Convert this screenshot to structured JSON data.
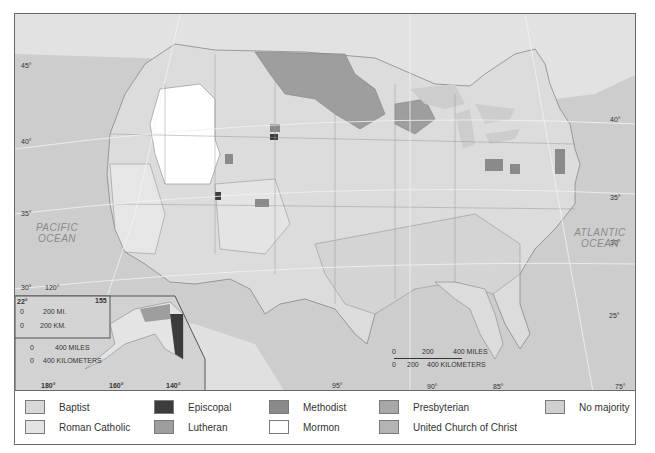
{
  "map": {
    "title": "Religious majority by county, United States",
    "oceans": [
      {
        "name": "PACIFIC",
        "line2": "OCEAN"
      },
      {
        "name": "ATLANTIC",
        "line2": "OCEAN"
      }
    ],
    "latitude_labels": [
      "45°",
      "40°",
      "35°",
      "30°",
      "25°"
    ],
    "longitude_labels": [
      "120°",
      "95°",
      "90°",
      "85°",
      "75°"
    ],
    "latitude_labels_east": [
      "40°",
      "35°",
      "30°",
      "25°"
    ],
    "scale_bar": {
      "miles_labels": [
        "0",
        "200",
        "400 MILES"
      ],
      "km_labels": [
        "0",
        "200",
        "400 KILOMETERS"
      ]
    },
    "alaska_inset": {
      "longitude_labels": [
        "180°",
        "160°",
        "140°"
      ],
      "scale_miles": [
        "0",
        "400 MILES"
      ],
      "scale_km": [
        "0",
        "400 KILOMETERS"
      ]
    },
    "hawaii_inset": {
      "lat_label": "22°",
      "lon_label": "155",
      "scale_miles": [
        "0",
        "200 MI."
      ],
      "scale_km": [
        "0",
        "200 KM."
      ]
    }
  },
  "legend": {
    "items": [
      {
        "label": "Baptist",
        "color": "#d8d8d8"
      },
      {
        "label": "Roman Catholic",
        "color": "#e4e4e4"
      },
      {
        "label": "Episcopal",
        "color": "#3c3c3c"
      },
      {
        "label": "Lutheran",
        "color": "#9e9e9e"
      },
      {
        "label": "Methodist",
        "color": "#8a8a8a"
      },
      {
        "label": "Mormon",
        "color": "#ffffff"
      },
      {
        "label": "Presbyterian",
        "color": "#a8a8a8"
      },
      {
        "label": "United Church of Christ",
        "color": "#b4b4b4"
      },
      {
        "label": "No majority",
        "color": "#d0d0d0"
      }
    ]
  }
}
